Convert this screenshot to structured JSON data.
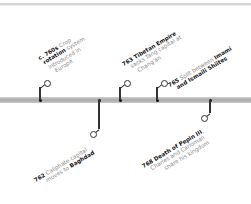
{
  "timeline": {
    "events": [
      {
        "id": "crop-rotation",
        "year": "c. 760s",
        "lines": [
          [
            "c. 760s",
            " Crop"
          ],
          [
            "rotation",
            " system"
          ],
          [
            "",
            "introduced in"
          ],
          [
            "",
            "Europe"
          ]
        ],
        "position": "above"
      },
      {
        "id": "baghdad",
        "year": "762",
        "lines": [
          [
            "762",
            " Caliphate capital"
          ],
          [
            "",
            "moves to "
          ],
          [
            "Baghdad",
            ""
          ]
        ],
        "position": "below"
      },
      {
        "id": "tibetan-empire",
        "year": "763",
        "lines": [
          [
            "763 Tibetan Empire",
            ""
          ],
          [
            "",
            "sacks Tang capital at"
          ],
          [
            "",
            "Chang'an"
          ]
        ],
        "position": "above"
      },
      {
        "id": "imami-ismaili",
        "year": "765",
        "lines": [
          [
            "765",
            " Split between "
          ],
          [
            "Imami",
            ""
          ],
          [
            "and Ismaili Shiites",
            ""
          ]
        ],
        "position": "above"
      },
      {
        "id": "pepin",
        "year": "768",
        "lines": [
          [
            "768 Death of Pepin III",
            ","
          ],
          [
            "",
            "Charles and Carloman"
          ],
          [
            "",
            "share his kingdom"
          ]
        ],
        "position": "below"
      }
    ]
  },
  "text": {
    "e0_l0b": "c. 760s",
    "e0_l0n": " Crop",
    "e0_l1b": "rotation",
    "e0_l1n": " system",
    "e0_l2n": "introduced in",
    "e0_l3n": "Europe",
    "e1_l0b": "762",
    "e1_l0n": " Caliphate capital",
    "e1_l1n": "moves to ",
    "e1_l1b": "Baghdad",
    "e2_l0b": "763 Tibetan Empire",
    "e2_l1n": "sacks Tang capital at",
    "e2_l2n": "Chang'an",
    "e3_l0b": "765",
    "e3_l0n": " Split between ",
    "e3_l0b2": "Imami",
    "e3_l1b": "and Ismaili Shiites",
    "e4_l0b": "768 Death of Pepin III",
    "e4_l0n": ",",
    "e4_l1n": "Charles and Carloman",
    "e4_l2n": "share his kingdom"
  },
  "colors": {
    "axis": "#b5b5b5",
    "connector": "#333333",
    "bold_text": "#111111",
    "muted_text": "#8a8a8a"
  }
}
